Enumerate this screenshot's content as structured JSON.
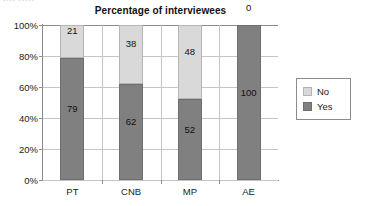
{
  "clipped_caption": "▪▪▪▪ ▪▪▪▪▪",
  "legend": {
    "position": "right",
    "items": [
      {
        "label": "No",
        "color": "#d9d9d9"
      },
      {
        "label": "Yes",
        "color": "#808080"
      }
    ]
  },
  "chart_data": {
    "type": "bar",
    "stacked": true,
    "stack_total": 100,
    "title": "Percentage of interviewees",
    "xlabel": "",
    "ylabel": "",
    "categories": [
      "PT",
      "CNB",
      "MP",
      "AE"
    ],
    "series": [
      {
        "name": "Yes",
        "color": "#808080",
        "values": [
          79,
          62,
          52,
          100
        ]
      },
      {
        "name": "No",
        "color": "#d9d9d9",
        "values": [
          21,
          38,
          48,
          0
        ]
      }
    ],
    "stack_order_bottom_to_top": [
      "Yes",
      "No"
    ],
    "data_labels": {
      "PT": {
        "Yes": "79",
        "No": "21"
      },
      "CNB": {
        "Yes": "62",
        "No": "38"
      },
      "MP": {
        "Yes": "52",
        "No": "48"
      },
      "AE": {
        "Yes": "100",
        "No": "0"
      }
    },
    "ylim": [
      0,
      100
    ],
    "yticks": [
      0,
      20,
      40,
      60,
      80,
      100
    ],
    "ytick_labels": [
      "0%",
      "20%",
      "40%",
      "60%",
      "80%",
      "100%"
    ],
    "grid": {
      "horizontal": true,
      "vertical": true
    }
  }
}
